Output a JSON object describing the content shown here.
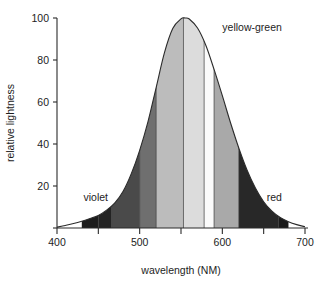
{
  "chart_data": {
    "type": "area",
    "title": "",
    "subtitle": "",
    "xlabel": "wavelength (NM)",
    "ylabel": "relative lightness",
    "xlim": [
      400,
      700
    ],
    "ylim": [
      0,
      100
    ],
    "grid": false,
    "legend": null,
    "x_ticks": [
      400,
      500,
      600,
      700
    ],
    "x_ticklabels": [
      "400",
      "500",
      "600",
      "700"
    ],
    "x_minor_ticks": [
      450,
      550,
      650
    ],
    "y_ticks": [
      0,
      20,
      40,
      60,
      80,
      100
    ],
    "y_ticklabels": [
      "",
      "20",
      "40",
      "60",
      "80",
      "100"
    ],
    "series": [
      {
        "name": "relative lightness",
        "x": [
          400,
          410,
          420,
          430,
          440,
          450,
          460,
          470,
          480,
          490,
          500,
          510,
          520,
          530,
          540,
          550,
          555,
          560,
          570,
          580,
          590,
          600,
          610,
          620,
          630,
          640,
          650,
          660,
          670,
          680,
          690,
          700
        ],
        "values": [
          0.4,
          1.2,
          2.1,
          3.2,
          4.5,
          6.0,
          8.5,
          12.0,
          17.5,
          26.0,
          37.0,
          50.5,
          67.0,
          83.5,
          95.0,
          99.6,
          100.0,
          99.5,
          95.2,
          87.0,
          75.5,
          63.0,
          50.0,
          38.0,
          27.5,
          19.0,
          12.5,
          8.0,
          5.0,
          3.0,
          1.6,
          0.6
        ]
      }
    ],
    "bands": [
      {
        "label": "violet",
        "start": 430,
        "end": 450,
        "gray": "#1c1c1c"
      },
      {
        "label": "violet-blue",
        "start": 450,
        "end": 466,
        "gray": "#232323"
      },
      {
        "label": "blue",
        "start": 466,
        "end": 500,
        "gray": "#4a4a4a"
      },
      {
        "label": "blue-green",
        "start": 500,
        "end": 520,
        "gray": "#6f6f6f"
      },
      {
        "label": "green",
        "start": 520,
        "end": 553,
        "gray": "#bcbcbc"
      },
      {
        "label": "yellow-green",
        "start": 553,
        "end": 578,
        "gray": "#dcdcdc"
      },
      {
        "label": "yellow",
        "start": 578,
        "end": 590,
        "gray": "#fbfbfb"
      },
      {
        "label": "orange",
        "start": 590,
        "end": 620,
        "gray": "#a9a9a9"
      },
      {
        "label": "red-orange",
        "start": 620,
        "end": 668,
        "gray": "#282828"
      },
      {
        "label": "red",
        "start": 668,
        "end": 680,
        "gray": "#1a1a1a"
      }
    ],
    "annotations": [
      {
        "name": "violet",
        "text": "violet",
        "x": 432,
        "y": 13
      },
      {
        "name": "yellow-green",
        "text": "yellow-green",
        "x": 600,
        "y": 94
      },
      {
        "name": "red",
        "text": "red",
        "x": 672,
        "y": 13
      }
    ],
    "colors": {
      "axis": "#2b2b2b",
      "curve": "#2b2b2b",
      "text": "#1d1d1d",
      "background": "#ffffff"
    }
  }
}
